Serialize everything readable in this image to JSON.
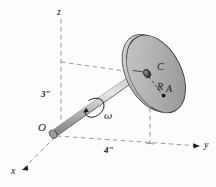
{
  "figure": {
    "type": "engineering-mechanics-diagram",
    "background_color": "#fdfdfd",
    "line_color": "#1b1b1b",
    "dash_color": "#8a8a8a",
    "disk_fill_light": "#d2d2d2",
    "disk_fill_dark": "#9a9a9a",
    "shaft_fill": "#b9b9b9"
  },
  "axes": {
    "z_label": "z",
    "y_label": "y",
    "x_label": "x",
    "origin_label": "O"
  },
  "dimensions": {
    "vertical": "3\"",
    "horizontal": "4\""
  },
  "points": {
    "center_label": "C",
    "radius_label": "R",
    "point_label": "A"
  },
  "motion": {
    "angular_velocity_label": "ω"
  }
}
